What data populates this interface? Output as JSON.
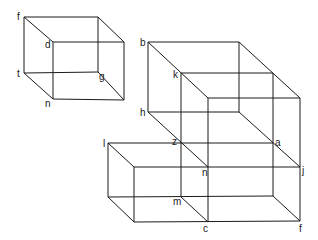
{
  "figure": {
    "shapes": [
      {
        "name": "small-cube",
        "labels": [
          "f",
          "d",
          "t",
          "g",
          "n"
        ]
      },
      {
        "name": "large-cube",
        "labels": [
          "b",
          "k",
          "h",
          "z",
          "a",
          "j",
          "n"
        ]
      },
      {
        "name": "lower-box",
        "labels": [
          "l",
          "z",
          "n",
          "m",
          "c",
          "f",
          "j",
          "a"
        ]
      }
    ],
    "labels": [
      {
        "id": "small-f",
        "text": "f"
      },
      {
        "id": "small-d",
        "text": "d"
      },
      {
        "id": "small-t",
        "text": "t"
      },
      {
        "id": "small-g",
        "text": "g"
      },
      {
        "id": "small-n",
        "text": "n"
      },
      {
        "id": "big-b",
        "text": "b"
      },
      {
        "id": "big-k",
        "text": "k"
      },
      {
        "id": "big-h",
        "text": "h"
      },
      {
        "id": "big-z",
        "text": "z"
      },
      {
        "id": "big-a",
        "text": "a"
      },
      {
        "id": "big-l",
        "text": "l"
      },
      {
        "id": "big-n",
        "text": "n"
      },
      {
        "id": "big-j",
        "text": "j"
      },
      {
        "id": "big-m",
        "text": "m"
      },
      {
        "id": "big-c",
        "text": "c"
      },
      {
        "id": "big-f",
        "text": "f"
      }
    ]
  }
}
